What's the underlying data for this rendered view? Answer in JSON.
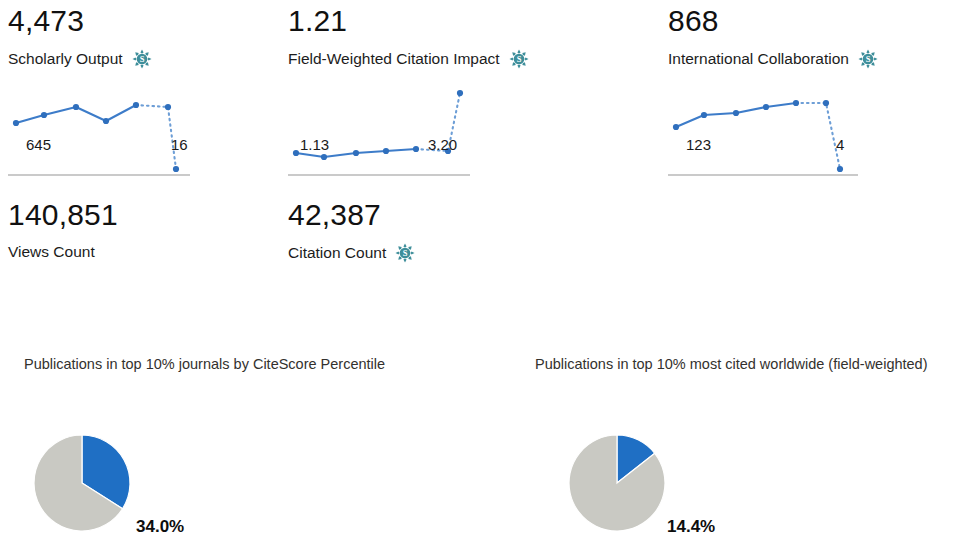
{
  "metrics": [
    {
      "value": "4,473",
      "label": "Scholarly Output",
      "icon": "scival-snowflake-icon",
      "has_icon": true,
      "start_label": "645",
      "end_label": "16",
      "spark": {
        "solid": [
          [
            8,
            48
          ],
          [
            36,
            40
          ],
          [
            68,
            32
          ],
          [
            98,
            46
          ],
          [
            128,
            30
          ]
        ],
        "dotted": [
          [
            128,
            30
          ],
          [
            160,
            32
          ],
          [
            168,
            94
          ]
        ],
        "points": [
          [
            8,
            48
          ],
          [
            36,
            40
          ],
          [
            68,
            32
          ],
          [
            98,
            46
          ],
          [
            128,
            30
          ],
          [
            160,
            32
          ],
          [
            168,
            94
          ]
        ]
      }
    },
    {
      "value": "1.21",
      "label": "Field-Weighted Citation Impact",
      "icon": "scival-snowflake-icon",
      "has_icon": true,
      "start_label": "1.13",
      "end_label": "3.20",
      "spark": {
        "solid": [
          [
            8,
            78
          ],
          [
            36,
            82
          ],
          [
            68,
            78
          ],
          [
            98,
            76
          ],
          [
            128,
            74
          ]
        ],
        "dotted": [
          [
            128,
            74
          ],
          [
            160,
            76
          ],
          [
            172,
            18
          ]
        ],
        "points": [
          [
            8,
            78
          ],
          [
            36,
            82
          ],
          [
            68,
            78
          ],
          [
            98,
            76
          ],
          [
            128,
            74
          ],
          [
            160,
            76
          ],
          [
            172,
            18
          ]
        ]
      }
    },
    {
      "value": "868",
      "label": "International Collaboration",
      "icon": "scival-snowflake-icon",
      "has_icon": true,
      "start_label": "123",
      "end_label": "4",
      "spark": {
        "solid": [
          [
            8,
            52
          ],
          [
            36,
            40
          ],
          [
            68,
            38
          ],
          [
            98,
            32
          ],
          [
            128,
            28
          ]
        ],
        "dotted": [
          [
            128,
            28
          ],
          [
            158,
            28
          ],
          [
            172,
            94
          ]
        ],
        "points": [
          [
            8,
            52
          ],
          [
            36,
            40
          ],
          [
            68,
            38
          ],
          [
            98,
            32
          ],
          [
            128,
            28
          ],
          [
            158,
            28
          ],
          [
            172,
            94
          ]
        ]
      }
    }
  ],
  "simple_metrics": [
    {
      "value": "140,851",
      "label": "Views Count",
      "has_icon": false,
      "icon": ""
    },
    {
      "value": "42,387",
      "label": "Citation Count",
      "has_icon": true,
      "icon": "scival-snowflake-icon"
    }
  ],
  "chart_data": [
    {
      "type": "pie",
      "title": "Publications in top 10% journals by CiteScore Percentile",
      "labels": [
        "In top 10%",
        "Other"
      ],
      "values": [
        34.0,
        66.0
      ],
      "value_label": "34.0%",
      "colors": [
        "#1f6fc4",
        "#c9c9c3"
      ],
      "legend": "none",
      "start_angle_deg": 0,
      "direction": "clockwise"
    },
    {
      "type": "pie",
      "title": "Publications in top 10% most cited worldwide (field-weighted)",
      "labels": [
        "In top 10%",
        "Other"
      ],
      "values": [
        14.4,
        85.6
      ],
      "value_label": "14.4%",
      "colors": [
        "#1f6fc4",
        "#c9c9c3"
      ],
      "legend": "none",
      "start_angle_deg": 0,
      "direction": "clockwise"
    }
  ],
  "colors": {
    "accent_blue": "#1f6fc4",
    "spark_blue": "#3d7cc9",
    "pie_gray": "#c9c9c3",
    "scival_teal": "#3e8e9a",
    "text": "#1a1a1a",
    "baseline": "#b9b9b9"
  }
}
